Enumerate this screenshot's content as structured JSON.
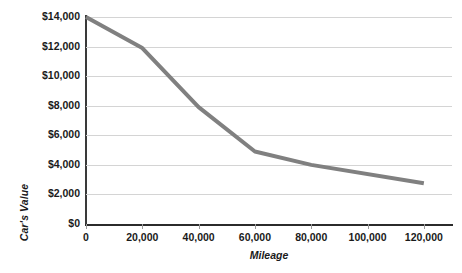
{
  "chart_data": {
    "type": "line",
    "title": "",
    "xlabel": "Mileage",
    "ylabel": "Car's Value",
    "x": [
      0,
      20000,
      40000,
      60000,
      80000,
      120000
    ],
    "values": [
      14000,
      11900,
      7900,
      4900,
      4000,
      2750
    ],
    "series": [
      {
        "name": "Car's Value",
        "values": [
          14000,
          11900,
          7900,
          4900,
          4000,
          2750
        ],
        "color": "#808080"
      }
    ],
    "xlim": [
      0,
      130000
    ],
    "ylim": [
      0,
      14000
    ],
    "xticks": [
      0,
      20000,
      40000,
      60000,
      80000,
      100000,
      120000
    ],
    "xtick_labels": [
      "0",
      "20,000",
      "40,000",
      "60,000",
      "80,000",
      "100,000",
      "120,000"
    ],
    "yticks": [
      0,
      2000,
      4000,
      6000,
      8000,
      10000,
      12000,
      14000
    ],
    "ytick_labels": [
      "$0",
      "$2,000",
      "$4,000",
      "$6,000",
      "$8,000",
      "$10,000",
      "$12,000",
      "$14,000"
    ],
    "grid": "horizontal",
    "legend": "none",
    "gridline_color": "#d4d4d4",
    "axis_color": "#2b2b2b",
    "line_color": "#808080",
    "line_width": 4
  }
}
